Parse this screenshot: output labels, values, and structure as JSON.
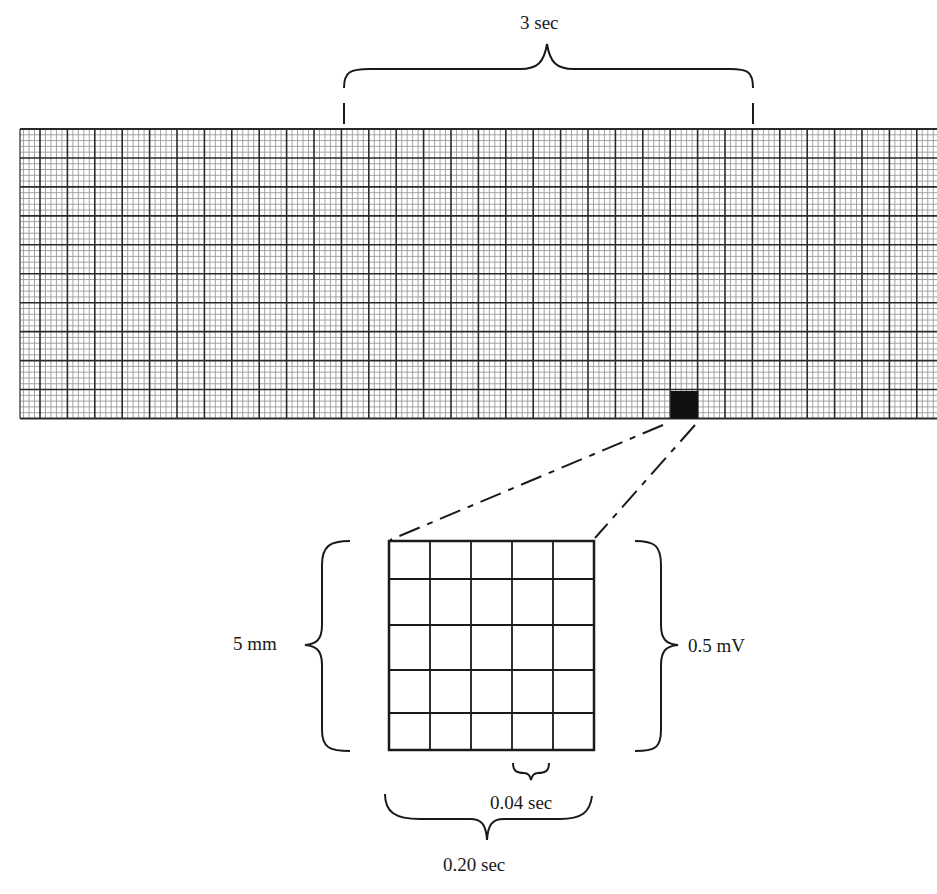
{
  "strip": {
    "time_span_label": "3 sec",
    "big_squares_in_span": 15,
    "big_square_count_vertical": 10,
    "minor_per_major": 5,
    "highlighted_square": "black"
  },
  "enlarged_square": {
    "rows": 5,
    "cols": 5,
    "height_label": "5 mm",
    "voltage_label": "0.5 mV",
    "small_square_time_label": "0.04 sec",
    "big_square_time_label": "0.20 sec"
  },
  "colors": {
    "background": "#ffffff",
    "minor_grid": "#9a9a9a",
    "major_grid": "#2a2a2a",
    "ink": "#1a1a1a"
  }
}
